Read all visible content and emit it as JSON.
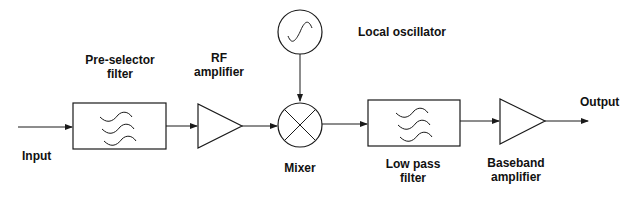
{
  "diagram": {
    "type": "block-diagram",
    "colors": {
      "stroke": "#1a1a1a",
      "text": "#111111",
      "background": "#ffffff"
    },
    "labels": {
      "input": "Input",
      "preselector_line1": "Pre-selector",
      "preselector_line2": "filter",
      "rf_amp_line1": "RF",
      "rf_amp_line2": "amplifier",
      "local_oscillator": "Local oscillator",
      "mixer": "Mixer",
      "lpf_line1": "Low pass",
      "lpf_line2": "filter",
      "baseband_line1": "Baseband",
      "baseband_line2": "amplifier",
      "output": "Output"
    },
    "blocks": [
      {
        "id": "preselector-filter",
        "shape": "rectangle",
        "symbol": "filter-waves"
      },
      {
        "id": "rf-amplifier",
        "shape": "triangle"
      },
      {
        "id": "local-oscillator",
        "shape": "circle",
        "symbol": "sine-wave"
      },
      {
        "id": "mixer",
        "shape": "circle",
        "symbol": "cross"
      },
      {
        "id": "low-pass-filter",
        "shape": "rectangle",
        "symbol": "filter-waves"
      },
      {
        "id": "baseband-amplifier",
        "shape": "triangle"
      }
    ],
    "connections": [
      [
        "input",
        "preselector-filter"
      ],
      [
        "preselector-filter",
        "rf-amplifier"
      ],
      [
        "rf-amplifier",
        "mixer"
      ],
      [
        "local-oscillator",
        "mixer"
      ],
      [
        "mixer",
        "low-pass-filter"
      ],
      [
        "low-pass-filter",
        "baseband-amplifier"
      ],
      [
        "baseband-amplifier",
        "output"
      ]
    ]
  }
}
